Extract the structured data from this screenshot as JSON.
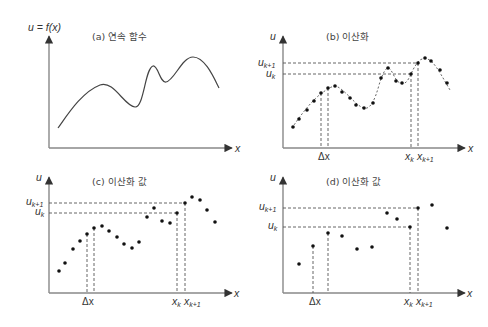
{
  "figure": {
    "panels": [
      {
        "id": "a",
        "title": "(a) 연속 함수",
        "y_label": "u = f(x)",
        "x_label": "x",
        "curve": [
          [
            58,
            128
          ],
          [
            72,
            110
          ],
          [
            86,
            94
          ],
          [
            100,
            85
          ],
          [
            112,
            88
          ],
          [
            125,
            101
          ],
          [
            135,
            107
          ],
          [
            142,
            96
          ],
          [
            148,
            75
          ],
          [
            153,
            66
          ],
          [
            158,
            72
          ],
          [
            165,
            82
          ],
          [
            172,
            76
          ],
          [
            182,
            63
          ],
          [
            193,
            57
          ],
          [
            203,
            62
          ],
          [
            212,
            74
          ],
          [
            219,
            88
          ]
        ]
      },
      {
        "id": "b",
        "title": "(b) 이산화",
        "y_label": "u",
        "x_label": "x",
        "u_k_label": "u",
        "u_k_sub": "k",
        "u_k1_label": "u",
        "u_k1_sub": "k+1",
        "dx_label": "Δx",
        "xk_label": "x",
        "xk_sub": "k",
        "xk1_label": "x",
        "xk1_sub": "k+1",
        "points": [
          [
            293,
            127
          ],
          [
            299,
            119
          ],
          [
            307,
            110
          ],
          [
            314,
            101
          ],
          [
            321,
            93
          ],
          [
            328,
            88
          ],
          [
            335,
            86
          ],
          [
            342,
            92
          ],
          [
            350,
            98
          ],
          [
            356,
            105
          ],
          [
            364,
            108
          ],
          [
            373,
            103
          ],
          [
            381,
            78
          ],
          [
            388,
            68
          ],
          [
            396,
            81
          ],
          [
            402,
            83
          ],
          [
            411,
            74
          ],
          [
            418,
            63
          ],
          [
            425,
            58
          ],
          [
            431,
            61
          ],
          [
            440,
            70
          ],
          [
            447,
            83
          ]
        ]
      },
      {
        "id": "c",
        "title": "(c) 이산화 값",
        "y_label": "u",
        "x_label": "x",
        "u_k_label": "u",
        "u_k_sub": "k",
        "u_k1_label": "u",
        "u_k1_sub": "k+1",
        "dx_label": "Δx",
        "xk_label": "x",
        "xk_sub": "k",
        "xk1_label": "x",
        "xk1_sub": "k+1",
        "points": [
          [
            59,
            271
          ],
          [
            65,
            263
          ],
          [
            73,
            249
          ],
          [
            80,
            241
          ],
          [
            87,
            234
          ],
          [
            94,
            228
          ],
          [
            102,
            226
          ],
          [
            109,
            231
          ],
          [
            117,
            237
          ],
          [
            124,
            244
          ],
          [
            132,
            248
          ],
          [
            139,
            242
          ],
          [
            147,
            217
          ],
          [
            154,
            208
          ],
          [
            162,
            221
          ],
          [
            170,
            223
          ],
          [
            177,
            213
          ],
          [
            185,
            203
          ],
          [
            192,
            197
          ],
          [
            200,
            200
          ],
          [
            207,
            210
          ],
          [
            215,
            222
          ]
        ]
      },
      {
        "id": "d",
        "title": "(d) 이산화 값",
        "y_label": "u",
        "x_label": "x",
        "u_k_label": "u",
        "u_k_sub": "k",
        "u_k1_label": "u",
        "u_k1_sub": "k+1",
        "dx_label": "Δx",
        "xk_label": "x",
        "xk_sub": "k",
        "xk1_label": "x",
        "xk1_sub": "k+1",
        "points": [
          [
            299,
            264
          ],
          [
            313,
            246
          ],
          [
            328,
            233
          ],
          [
            342,
            236
          ],
          [
            357,
            249
          ],
          [
            372,
            247
          ],
          [
            387,
            213
          ],
          [
            397,
            219
          ],
          [
            410,
            227
          ],
          [
            418,
            208
          ],
          [
            432,
            205
          ],
          [
            447,
            228
          ]
        ]
      }
    ]
  }
}
